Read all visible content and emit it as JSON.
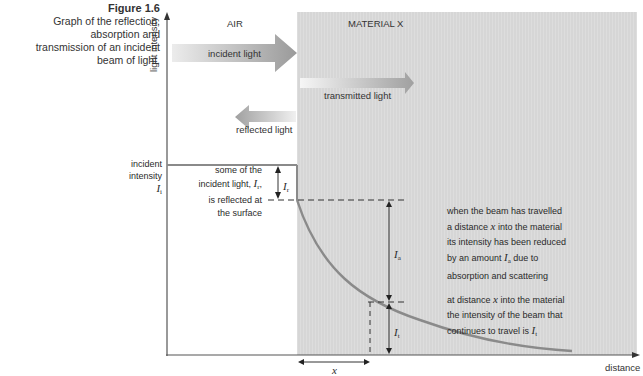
{
  "caption": {
    "figure": "Figure 1.6",
    "lines": [
      "Graph of the reflection,",
      "absorption and",
      "transmission of an incident",
      "beam of light."
    ]
  },
  "regions": {
    "left": "AIR",
    "right": "MATERIAL X"
  },
  "axes": {
    "y_label": "light intensity",
    "x_label": "distance"
  },
  "arrows": {
    "incident": "incident light",
    "transmitted": "transmitted light",
    "reflected": "reflected light"
  },
  "incident_label": {
    "line1": "incident",
    "line2": "intensity",
    "symbol": "I",
    "sub": "i"
  },
  "reflect_note": {
    "line1": "some of the",
    "line2": "incident light, ",
    "sym": "I",
    "sub": "r",
    "line2_end": ",",
    "line3": "is reflected at",
    "line4": "the surface"
  },
  "labels": {
    "Ir": {
      "sym": "I",
      "sub": "r"
    },
    "Ia": {
      "sym": "I",
      "sub": "a"
    },
    "It": {
      "sym": "I",
      "sub": "t"
    },
    "x": "x"
  },
  "absorb_note": {
    "l1": "when the beam has travelled",
    "l2a": "a distance ",
    "l2x": "x",
    "l2b": " into the material",
    "l3": "its intensity has been reduced",
    "l4a": "by an amount ",
    "l4sym": "I",
    "l4sub": "a",
    "l4b": " due to",
    "l5": "absorption and scattering"
  },
  "transmit_note": {
    "l1a": "at distance ",
    "l1x": "x",
    "l1b": " into the material",
    "l2": "the intensity of the beam that",
    "l3a": "continues to travel is ",
    "l3sym": "I",
    "l3sub": "t"
  },
  "colors": {
    "material": "#d6d6d6",
    "curve": "#8a8a8a",
    "arrow": "#9a9a9a",
    "axis": "#555555"
  }
}
